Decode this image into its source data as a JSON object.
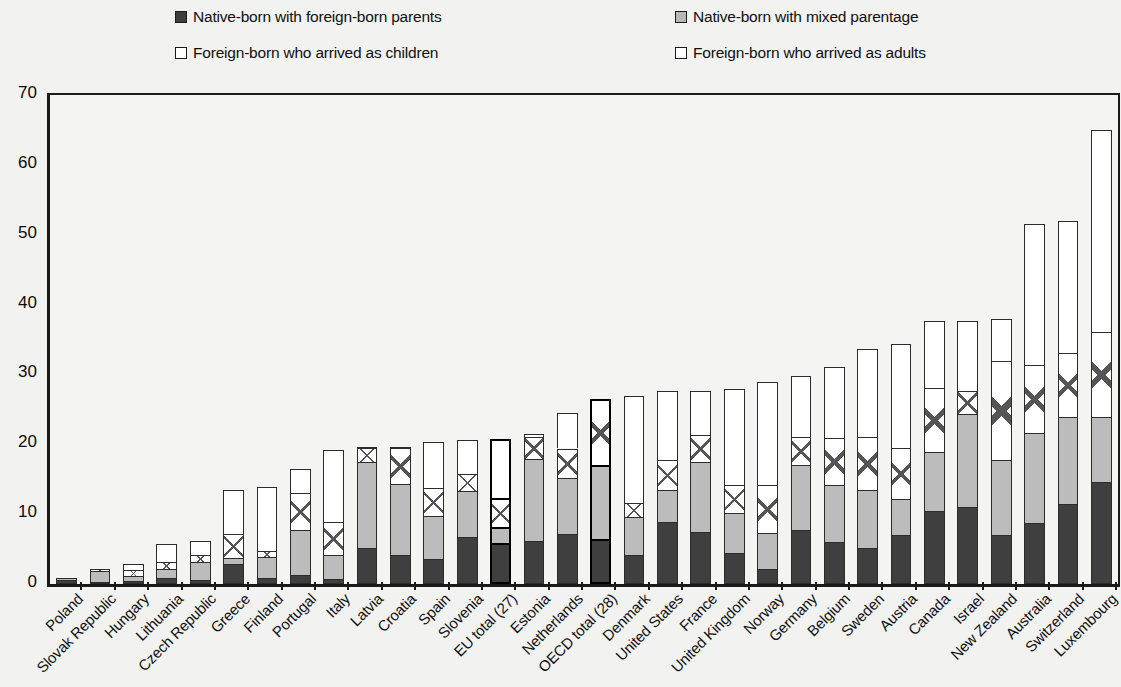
{
  "legend": {
    "items": [
      {
        "label": "Native-born with foreign-born parents",
        "swatch": "dark-solid-swatch",
        "color": "#3d3d3d"
      },
      {
        "label": "Native-born with mixed parentage",
        "swatch": "light-gray-swatch",
        "color": "#b8b8b8"
      },
      {
        "label": "Foreign-born who arrived as children",
        "swatch": "white-swatch",
        "color": "#ffffff"
      },
      {
        "label": "Foreign-born who arrived as adults",
        "swatch": "white-swatch",
        "color": "#ffffff"
      }
    ]
  },
  "axis": {
    "y_ticks": [
      "0",
      "10",
      "20",
      "30",
      "40",
      "50",
      "60",
      "70"
    ]
  },
  "chart_data": {
    "type": "bar",
    "title": "",
    "subtitle": "",
    "xlabel": "",
    "ylabel": "",
    "ylim": [
      0,
      70
    ],
    "ytick_step": 10,
    "grid": false,
    "stacked": true,
    "legend_position": "top",
    "categories": [
      "Poland",
      "Slovak Republic",
      "Hungary",
      "Lithuania",
      "Czech Republic",
      "Greece",
      "Finland",
      "Portugal",
      "Italy",
      "Latvia",
      "Croatia",
      "Spain",
      "Slovenia",
      "EU total (27)",
      "Estonia",
      "Netherlands",
      "OECD total (28)",
      "Denmark",
      "United States",
      "France",
      "United Kingdom",
      "Norway",
      "Germany",
      "Belgium",
      "Sweden",
      "Austria",
      "Canada",
      "Israel",
      "New Zealand",
      "Australia",
      "Switzerland",
      "Luxembourg"
    ],
    "series": [
      {
        "name": "Native-born with foreign-born parents",
        "values": [
          0.6,
          0.3,
          0.4,
          0.9,
          0.6,
          2.8,
          0.9,
          1.3,
          0.7,
          5.1,
          4.1,
          3.6,
          6.8,
          5.9,
          6.1,
          7.2,
          6.4,
          4.2,
          8.9,
          7.4,
          4.5,
          2.1,
          7.7,
          6.0,
          5.1,
          7.0,
          10.4,
          11.0,
          7.0,
          8.7,
          11.4,
          14.6
        ]
      },
      {
        "name": "Native-born with mixed parentage",
        "values": [
          0.2,
          1.5,
          0.7,
          1.2,
          2.6,
          0.9,
          2.9,
          6.5,
          3.5,
          12.3,
          10.2,
          6.2,
          6.5,
          2.2,
          11.8,
          8.0,
          10.7,
          5.4,
          4.6,
          10.1,
          5.6,
          5.2,
          9.3,
          8.2,
          8.3,
          5.2,
          8.5,
          13.4,
          10.8,
          12.9,
          12.5,
          9.3
        ]
      },
      {
        "name": "Foreign-born who arrived as children",
        "values": [
          0.0,
          0.3,
          0.9,
          1.1,
          1.0,
          3.5,
          0.9,
          5.2,
          4.7,
          2.1,
          5.2,
          4.0,
          2.4,
          4.2,
          3.2,
          4.2,
          9.4,
          2.0,
          4.2,
          3.9,
          4.1,
          6.9,
          4.1,
          6.7,
          7.6,
          7.2,
          9.1,
          3.2,
          14.1,
          9.7,
          9.1,
          12.2
        ]
      },
      {
        "name": "Foreign-born who arrived as adults",
        "values": [
          0.0,
          0.0,
          0.9,
          2.5,
          1.9,
          6.2,
          9.2,
          3.4,
          10.3,
          0.1,
          0.1,
          6.5,
          4.9,
          8.4,
          0.4,
          5.1,
          0.0,
          15.3,
          10.0,
          6.3,
          13.7,
          14.7,
          8.7,
          10.2,
          12.6,
          14.9,
          9.7,
          10.1,
          6.0,
          20.2,
          18.9,
          28.9
        ]
      }
    ],
    "totals": [
      0.8,
      2.1,
      2.9,
      5.7,
      6.1,
      13.4,
      13.9,
      16.4,
      19.2,
      19.6,
      19.6,
      20.3,
      20.6,
      20.7,
      21.5,
      24.5,
      26.5,
      26.9,
      27.7,
      27.7,
      27.9,
      28.9,
      29.8,
      31.1,
      33.6,
      34.3,
      37.7,
      37.7,
      37.9,
      51.5,
      51.9,
      65.0
    ],
    "highlighted_categories": [
      "EU total (27)",
      "OECD total (28)"
    ]
  }
}
